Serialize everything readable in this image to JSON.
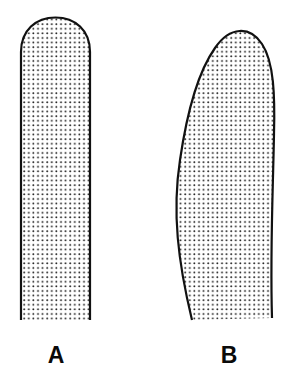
{
  "figure": {
    "background_color": "#ffffff",
    "width": 301,
    "height": 375,
    "outline_color": "#111111",
    "outline_width": 2.2,
    "fill_color": "#ffffff",
    "stipple_color": "#1a1a1a",
    "stipple_dot_radius": 0.95,
    "stipple_spacing": 4.6,
    "label_color": "#0a0a0a",
    "label_font_size": 23
  },
  "shapes": [
    {
      "id": "shape-a",
      "label": "A",
      "description": "straight vertical form with rounded dome top and open flat bottom",
      "label_x": 56,
      "label_y": 363,
      "bbox": {
        "x": 21,
        "y": 17,
        "width": 69,
        "height": 303
      },
      "path": "M 21 320 L 21 52 C 21 30 36 17.5 55.5 17.5 C 75 17.5 90 30 90 52 L 90 320",
      "bottom_open": true
    },
    {
      "id": "shape-b",
      "label": "B",
      "description": "curved crescent form bulging right, rounded tilted top, slanted open bottom",
      "label_x": 229,
      "label_y": 363,
      "bbox": {
        "x": 152,
        "y": 17,
        "width": 123,
        "height": 303
      },
      "path": "M 192 320 C 178 262 172 212 180 160 C 187 112 198 72 215 48 C 230 26 250 26 262 44 C 274 62 275 96 274 134 C 273 190 270 252 272 318",
      "inner_path": "M 192 320 C 178 262 172 212 180 160 C 187 112 198 72 215 48",
      "bottom_open": true
    }
  ],
  "labels": {
    "a": "A",
    "b": "B"
  }
}
